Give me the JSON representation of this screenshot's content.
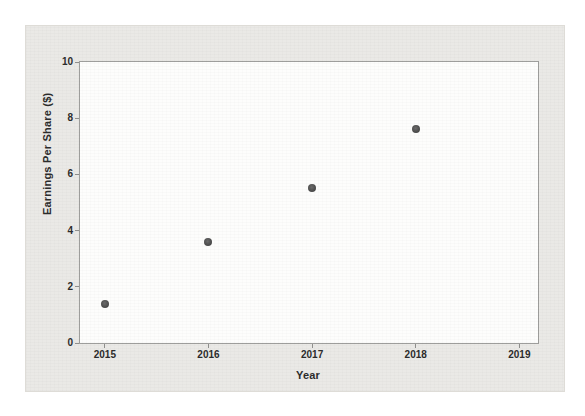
{
  "colors": {
    "page_bg": "#ffffff",
    "figure_bg": "#eae9e6",
    "plot_bg": "#fdfdfc",
    "axis_line": "#9e9e9c",
    "text": "#2c2c2c",
    "point": "#4a4a4a"
  },
  "chart_data": {
    "type": "scatter",
    "title": "",
    "xlabel": "Year",
    "ylabel": "Earnings Per Share ($)",
    "x": [
      2015,
      2016,
      2017,
      2018
    ],
    "y": [
      1.4,
      3.6,
      5.5,
      7.6
    ],
    "points": [
      {
        "year": 2015,
        "eps": 1.4
      },
      {
        "year": 2016,
        "eps": 3.6
      },
      {
        "year": 2017,
        "eps": 5.5
      },
      {
        "year": 2018,
        "eps": 7.6
      }
    ],
    "x_ticks": [
      2015,
      2016,
      2017,
      2018,
      2019
    ],
    "y_ticks": [
      0,
      2,
      4,
      6,
      8,
      10
    ],
    "xlim": [
      2014.76,
      2019.18
    ],
    "ylim": [
      0,
      10
    ],
    "grid": false,
    "legend": null
  }
}
